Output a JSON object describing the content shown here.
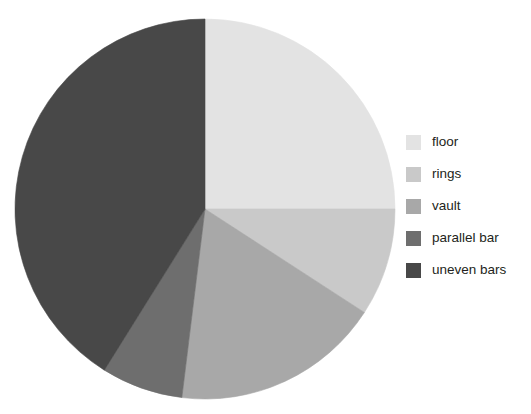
{
  "chart_data": {
    "type": "pie",
    "title": "",
    "subtitle": "",
    "xlabel": "",
    "ylabel": "",
    "grid": false,
    "legend_position": "right",
    "start_angle_deg": 0,
    "direction": "clockwise",
    "center": {
      "cx": 205,
      "cy": 209,
      "r": 190
    },
    "categories": [
      "floor",
      "rings",
      "vault",
      "parallel bar",
      "uneven bars"
    ],
    "values": [
      25,
      9,
      18,
      7,
      41
    ],
    "units": "percent",
    "colors": [
      "#e3e3e3",
      "#c9c9c9",
      "#a8a8a8",
      "#6e6e6e",
      "#484848"
    ],
    "slices": [
      {
        "label": "floor",
        "value": 25,
        "angle_start_deg": 0,
        "angle_end_deg": 90,
        "color": "#e3e3e3"
      },
      {
        "label": "rings",
        "value": 9,
        "angle_start_deg": 90,
        "angle_end_deg": 123,
        "color": "#c9c9c9"
      },
      {
        "label": "vault",
        "value": 18,
        "angle_start_deg": 123,
        "angle_end_deg": 187,
        "color": "#a8a8a8"
      },
      {
        "label": "parallel bar",
        "value": 7,
        "angle_start_deg": 187,
        "angle_end_deg": 212,
        "color": "#6e6e6e"
      },
      {
        "label": "uneven bars",
        "value": 41,
        "angle_start_deg": 212,
        "angle_end_deg": 360,
        "color": "#484848"
      }
    ]
  },
  "legend": {
    "items": [
      {
        "label": "floor",
        "color": "#e3e3e3"
      },
      {
        "label": "rings",
        "color": "#c9c9c9"
      },
      {
        "label": "vault",
        "color": "#a8a8a8"
      },
      {
        "label": "parallel bar",
        "color": "#6e6e6e"
      },
      {
        "label": "uneven bars",
        "color": "#484848"
      }
    ]
  }
}
